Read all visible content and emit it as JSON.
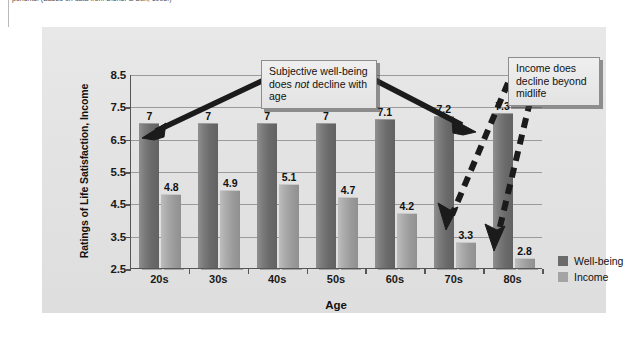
{
  "source_caption": "ponents. (Based on data from Diener & Suh, 1998.)",
  "legend": {
    "position": "right",
    "items": [
      {
        "label": "Well-being",
        "swatch": "wellbeing-swatch",
        "color": "#6b6b6b"
      },
      {
        "label": "Income",
        "swatch": "income-swatch",
        "color": "#a4a4a4"
      }
    ]
  },
  "callouts": [
    {
      "id": "wellbeing-callout",
      "line1": "Subjective well-being",
      "line2_pre": "does ",
      "line2_em": "not",
      "line2_post": " decline with",
      "line3": "age",
      "arrow_style": "solid",
      "points_to": [
        "20s well-being bar",
        "80s well-being bar"
      ]
    },
    {
      "id": "income-callout",
      "line1": "Income does",
      "line2": "decline beyond",
      "line3": "midlife",
      "arrow_style": "dashed",
      "points_to": [
        "70s income bar",
        "80s income bar"
      ]
    }
  ],
  "chart_data": {
    "type": "bar",
    "title": "",
    "xlabel": "Age",
    "ylabel": "Ratings of Life Satisfaction, Income",
    "categories": [
      "20s",
      "30s",
      "40s",
      "50s",
      "60s",
      "70s",
      "80s"
    ],
    "series": [
      {
        "name": "Well-being",
        "color": "#6b6b6b",
        "values": [
          7,
          7,
          7,
          7,
          7.1,
          7.2,
          7.3
        ],
        "labels": [
          "7",
          "7",
          "7",
          "7",
          "7.1",
          "7.2",
          "7.3"
        ]
      },
      {
        "name": "Income",
        "color": "#a4a4a4",
        "values": [
          4.8,
          4.9,
          5.1,
          4.7,
          4.2,
          3.3,
          2.8
        ],
        "labels": [
          "4.8",
          "4.9",
          "5.1",
          "4.7",
          "4.2",
          "3.3",
          "2.8"
        ]
      }
    ],
    "ylim": [
      2.5,
      8.5
    ],
    "yticks": [
      8.5,
      7.5,
      6.5,
      5.5,
      4.5,
      3.5,
      2.5
    ],
    "ytick_labels": [
      "8.5",
      "7.5",
      "6.5",
      "5.5",
      "4.5",
      "3.5",
      "2.5"
    ],
    "grid": true,
    "legend_position": "right"
  }
}
